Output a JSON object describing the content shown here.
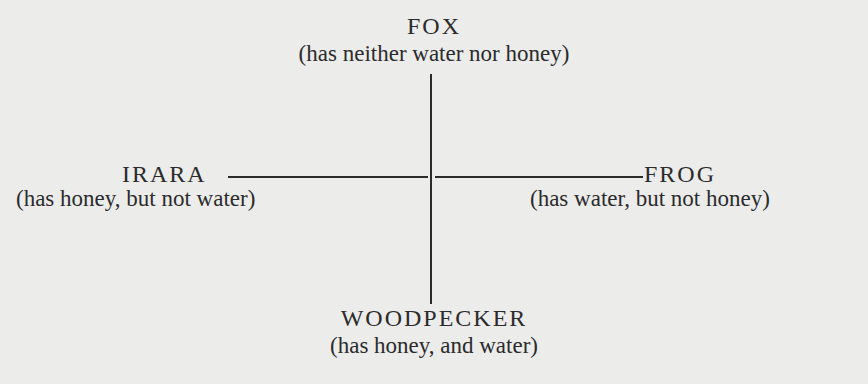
{
  "diagram": {
    "type": "cross-diagram",
    "colors": {
      "background": "#ececeb",
      "ink": "#2b2b2b"
    },
    "nodes": {
      "top": {
        "name": "FOX",
        "description": "(has neither water nor honey)"
      },
      "left": {
        "name": "IRARA",
        "description": "(has honey, but not water)"
      },
      "right": {
        "name": "FROG",
        "description": "(has water, but not honey)"
      },
      "bottom": {
        "name": "WOODPECKER",
        "description": "(has honey, and water)"
      }
    },
    "axes": {
      "vertical": "connects FOX (top) to WOODPECKER (bottom)",
      "horizontal": "connects IRARA (left) to FROG (right)"
    }
  }
}
